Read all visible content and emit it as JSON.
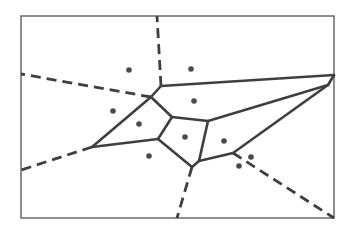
{
  "diagram": {
    "type": "voronoi",
    "colors": {
      "frame": "#6a6a6a",
      "edge": "#3f3f3f",
      "site": "#4a4a4a",
      "background": "#ffffff"
    },
    "frame": {
      "x": 21,
      "y": 16,
      "width": 313,
      "height": 202
    },
    "vertices": {
      "A": [
        161,
        86
      ],
      "B": [
        151,
        97
      ],
      "C": [
        92,
        147
      ],
      "E": [
        172,
        117
      ],
      "F": [
        208,
        121
      ],
      "G": [
        158,
        139
      ],
      "H": [
        199,
        161
      ],
      "I": [
        192,
        167
      ],
      "J": [
        233,
        153
      ],
      "P": [
        328,
        85
      ],
      "R": [
        334,
        75
      ]
    },
    "finite_edges": [
      [
        "A",
        "B"
      ],
      [
        "A",
        "R"
      ],
      [
        "B",
        "C"
      ],
      [
        "B",
        "E"
      ],
      [
        "C",
        "G"
      ],
      [
        "E",
        "G"
      ],
      [
        "E",
        "F"
      ],
      [
        "F",
        "H"
      ],
      [
        "G",
        "I"
      ],
      [
        "H",
        "I"
      ],
      [
        "H",
        "J"
      ],
      [
        "F",
        "P"
      ],
      [
        "J",
        "P"
      ],
      [
        "P",
        "R"
      ]
    ],
    "infinite_rays": [
      {
        "from": "A",
        "to": [
          157,
          16
        ]
      },
      {
        "from": "B",
        "to": [
          21,
          74
        ]
      },
      {
        "from": "C",
        "to": [
          21,
          170
        ]
      },
      {
        "from": "I",
        "to": [
          177,
          218
        ]
      },
      {
        "from": "J",
        "to": [
          334,
          218
        ]
      }
    ],
    "sites": [
      [
        129,
        70
      ],
      [
        191,
        69
      ],
      [
        113,
        111
      ],
      [
        139,
        124
      ],
      [
        194,
        101
      ],
      [
        185,
        137
      ],
      [
        149,
        156
      ],
      [
        224,
        141
      ],
      [
        239,
        166
      ],
      [
        251,
        157
      ]
    ]
  }
}
